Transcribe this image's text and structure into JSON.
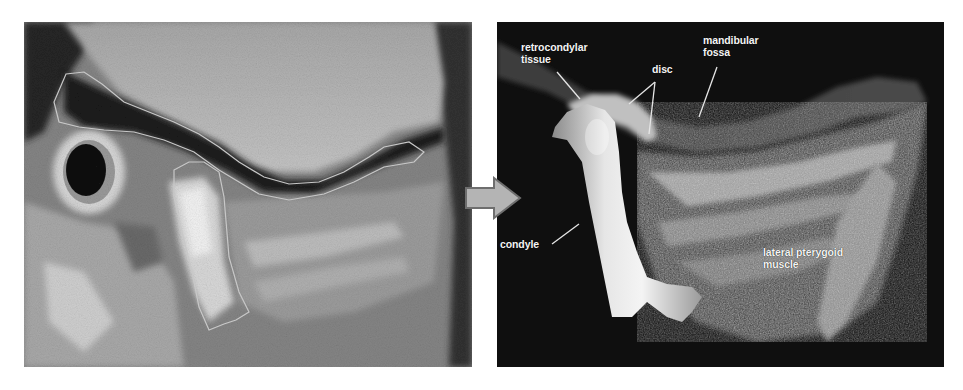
{
  "figure": {
    "left_panel": {
      "description": "MRI sagittal slice with traced outlines of TMJ structures",
      "outline_color": "#c8c8c8"
    },
    "arrow": {
      "direction": "right",
      "fill": "#b4b4b4",
      "stroke": "#6e6e6e"
    },
    "right_panel": {
      "description": "3D rendered reconstruction of temporomandibular joint",
      "labels": {
        "retrocondylar": [
          "retrocondylar",
          "tissue"
        ],
        "disc": "disc",
        "fossa": [
          "mandibular",
          "fossa"
        ],
        "condyle": "condyle",
        "muscle": [
          "lateral pterygoid",
          "muscle"
        ]
      }
    }
  }
}
